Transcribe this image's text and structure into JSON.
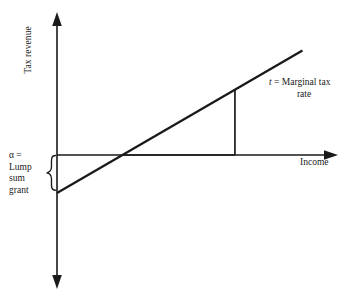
{
  "figure": {
    "background_color": "#ffffff",
    "ink_color": "#1a1a1a",
    "y_axis_title": "Tax revenue",
    "x_axis_title": "Income",
    "alpha_label": {
      "line1": "α  =",
      "line2": "Lump",
      "line3": "sum",
      "line4": "grant",
      "brace": "{"
    },
    "slope_label": {
      "symbol": "t",
      "equals": " = Marginal tax",
      "line2": "rate"
    }
  },
  "chart_data": {
    "type": "line",
    "title": "",
    "xlabel": "Income",
    "ylabel": "Tax revenue",
    "grid": false,
    "legend": "none",
    "annotations": [
      {
        "text": "α = Lump sum grant",
        "role": "y-intercept-bracket",
        "value": -1.0,
        "at": "x=0"
      },
      {
        "text": "t = Marginal tax rate",
        "role": "slope-triangle",
        "value": 0.63
      }
    ],
    "xlim": [
      0,
      6.6
    ],
    "ylim": [
      -3.5,
      3.5
    ],
    "series": [
      {
        "name": "Linear income tax schedule",
        "x": [
          0,
          6.0
        ],
        "y": [
          -1.0,
          2.75
        ],
        "intercept": -1.0,
        "slope": 0.625,
        "x_zero_crossing": 1.6
      }
    ],
    "axes": {
      "x_axis_y_value": 0,
      "y_axis_x_value": 0,
      "x_axis_arrow": "right",
      "y_axis_arrows": [
        "up",
        "down"
      ]
    },
    "slope_triangle": {
      "horizontal_run_x": [
        1.6,
        4.35
      ],
      "vertical_rise_y": [
        0,
        1.72
      ],
      "corner_x": 4.35
    }
  }
}
